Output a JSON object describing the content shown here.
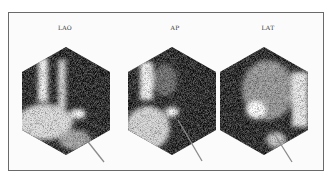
{
  "figure": {
    "background": "#ffffff",
    "frame_color": "#6a6a6a",
    "panels": [
      {
        "id": "lao",
        "label": "LAO",
        "label_x": 65
      },
      {
        "id": "ap",
        "label": "AP",
        "label_x": 175
      },
      {
        "id": "lat",
        "label": "LAT",
        "label_x": 268
      }
    ],
    "arrow_color": "#8a8a8a"
  }
}
